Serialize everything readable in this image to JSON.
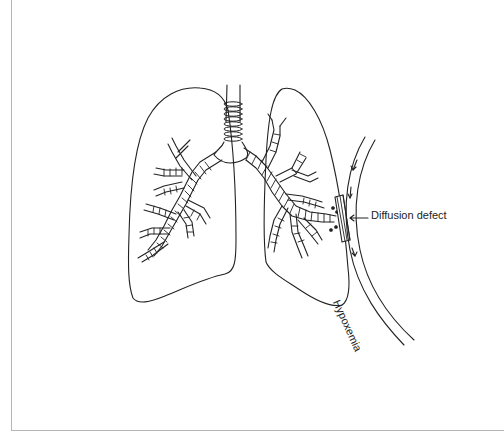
{
  "figure": {
    "labels": {
      "diffusion_defect": "Diffusion defect",
      "hypoxemia": "Hypoxemia"
    },
    "icons": [
      "lungs-illustration",
      "trachea",
      "bronchial-tree",
      "blood-vessel",
      "flow-arrow",
      "diffusion-barrier"
    ],
    "colors": {
      "line": "#222222",
      "frame": "#b5b5b5",
      "background": "#ffffff"
    }
  }
}
